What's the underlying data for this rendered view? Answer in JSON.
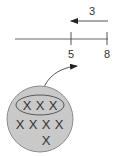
{
  "diagram": {
    "subtraction_arrow": {
      "label": "3",
      "direction": "left"
    },
    "number_line": {
      "ticks": [
        {
          "value": "5"
        },
        {
          "value": "8"
        }
      ]
    },
    "group_circle": {
      "highlighted_group": {
        "marks": [
          "X",
          "X",
          "X"
        ]
      },
      "remaining_rows": [
        {
          "marks": [
            "X",
            "X",
            "X",
            "X"
          ]
        },
        {
          "marks": [
            "X"
          ]
        }
      ]
    },
    "colors": {
      "line": "#555555",
      "circle_fill": "#c9c9c9",
      "circle_stroke": "#8a8a8a",
      "text": "#333333"
    }
  }
}
